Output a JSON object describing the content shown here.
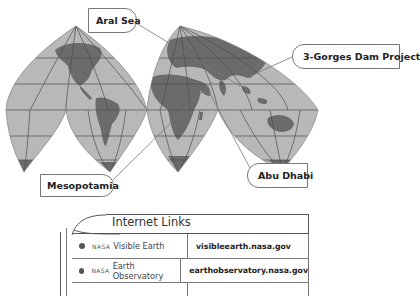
{
  "map": {
    "projection": "interrupted world map (goode-style lobes)",
    "colors": {
      "ocean": "#b8b8b8",
      "land": "#6b6b6b",
      "grid": "#4e4e4e",
      "outline": "#8a8a8a"
    },
    "callouts": [
      {
        "id": "aral-sea",
        "label": "Aral Sea"
      },
      {
        "id": "three-gorges",
        "label": "3-Gorges Dam Project"
      },
      {
        "id": "mesopotamia",
        "label": "Mesopotamia"
      },
      {
        "id": "abu-dhabi",
        "label": "Abu Dhabi"
      }
    ]
  },
  "links_table": {
    "title": "Internet Links",
    "rows": [
      {
        "org": "NASA",
        "name": "Visible Earth",
        "url": "visibleearth.nasa.gov"
      },
      {
        "org": "NASA",
        "name": "Earth Observatory",
        "url": "earthobservatory.nasa.gov"
      }
    ]
  }
}
